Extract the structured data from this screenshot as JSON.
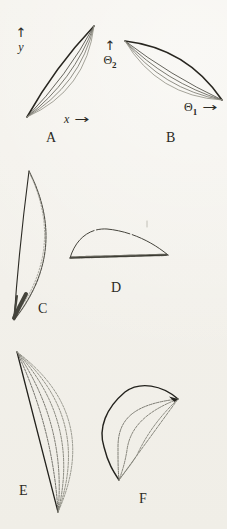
{
  "figure": {
    "paper_color": "#f3f1eb",
    "ink_color": "#282620",
    "faint_ink_color": "#8e8d82"
  },
  "icons": {
    "up_arrow": "↑",
    "right_arrow": "→"
  },
  "panels": [
    {
      "id": "A",
      "label": "A",
      "vertical_axis": {
        "symbol": "y"
      },
      "horizontal_axis": {
        "symbol": "x"
      }
    },
    {
      "id": "B",
      "label": "B",
      "vertical_axis": {
        "symbol": "Θ",
        "subscript": "2"
      },
      "horizontal_axis": {
        "symbol": "Θ",
        "subscript": "1"
      }
    },
    {
      "id": "C",
      "label": "C"
    },
    {
      "id": "D",
      "label": "D"
    },
    {
      "id": "E",
      "label": "E"
    },
    {
      "id": "F",
      "label": "F"
    }
  ]
}
